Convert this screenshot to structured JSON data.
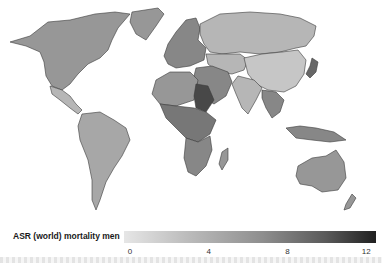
{
  "map": {
    "type": "choropleth",
    "projection": "world",
    "fill_scale": "grayscale-light-to-dark",
    "colors": {
      "low": "#e6e6e6",
      "mid": "#8e8e8e",
      "high": "#202020",
      "border": "#3a3a3a",
      "background": "#ffffff"
    },
    "regions": [
      {
        "name": "north-america",
        "shade_value": 5
      },
      {
        "name": "greenland",
        "shade_value": 5
      },
      {
        "name": "central-america",
        "shade_value": 3
      },
      {
        "name": "south-america",
        "shade_value": 4
      },
      {
        "name": "europe",
        "shade_value": 6
      },
      {
        "name": "russia",
        "shade_value": 3
      },
      {
        "name": "middle-east",
        "shade_value": 6
      },
      {
        "name": "africa-north",
        "shade_value": 5
      },
      {
        "name": "africa-central",
        "shade_value": 7
      },
      {
        "name": "sudan",
        "shade_value": 10
      },
      {
        "name": "africa-south",
        "shade_value": 6
      },
      {
        "name": "madagascar",
        "shade_value": 5
      },
      {
        "name": "central-asia",
        "shade_value": 3
      },
      {
        "name": "china",
        "shade_value": 2
      },
      {
        "name": "india",
        "shade_value": 3
      },
      {
        "name": "southeast-asia",
        "shade_value": 6
      },
      {
        "name": "japan",
        "shade_value": 8
      },
      {
        "name": "indonesia",
        "shade_value": 6
      },
      {
        "name": "australia",
        "shade_value": 5
      },
      {
        "name": "new-zealand",
        "shade_value": 5
      }
    ]
  },
  "legend": {
    "title": "ASR (world) mortality men",
    "min": 0,
    "max": 12.5,
    "ticks": [
      "0",
      "4",
      "8",
      "12"
    ],
    "tick_values": [
      0,
      4,
      8,
      12
    ]
  }
}
